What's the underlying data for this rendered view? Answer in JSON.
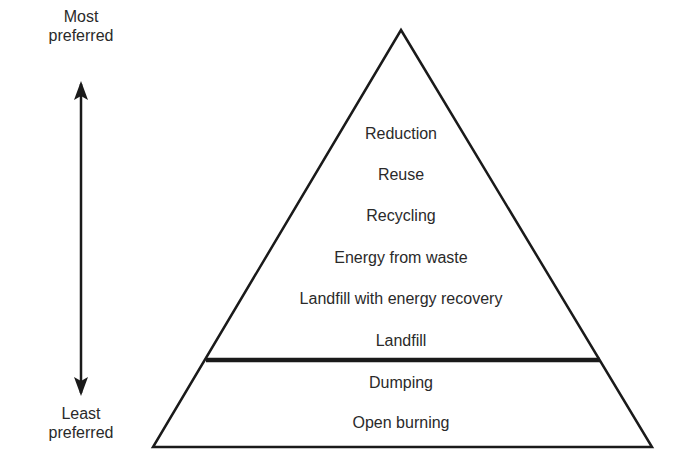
{
  "diagram": {
    "type": "pyramid",
    "scale": {
      "top_label": "Most preferred",
      "top_label_lines": [
        "Most",
        "preferred"
      ],
      "bottom_label": "Least preferred",
      "bottom_label_lines": [
        "Least",
        "preferred"
      ],
      "arrow": "double-headed vertical"
    },
    "upper_tiers": [
      {
        "label": "Reduction"
      },
      {
        "label": "Reuse"
      },
      {
        "label": "Recycling"
      },
      {
        "label": "Energy from waste"
      },
      {
        "label": "Landfill with energy recovery"
      },
      {
        "label": "Landfill"
      }
    ],
    "lower_tiers": [
      {
        "label": "Dumping"
      },
      {
        "label": "Open burning"
      }
    ],
    "colors": {
      "line": "#1a1a1a",
      "text": "#2a2a2a",
      "background": "#ffffff"
    }
  }
}
